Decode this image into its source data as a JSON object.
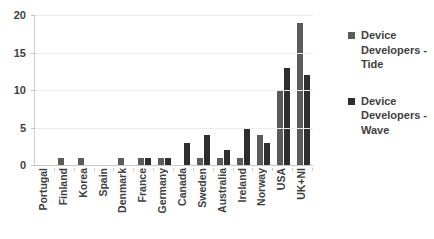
{
  "chart_data": {
    "type": "bar",
    "title": "",
    "subtitle": "",
    "xlabel": "",
    "ylabel": "",
    "ylim": [
      0,
      20
    ],
    "yticks": [
      0,
      5,
      10,
      15,
      20
    ],
    "ytick_labels": [
      "0",
      "5",
      "10",
      "15",
      "20"
    ],
    "grid": true,
    "legend_position": "right",
    "categories": [
      "Portugal",
      "Finland",
      "Korea",
      "Spain",
      "Denmark",
      "France",
      "Germany",
      "Canada",
      "Sweden",
      "Australia",
      "Ireland",
      "Norway",
      "USA",
      "UK+NI"
    ],
    "series": [
      {
        "name": "Device Developers - Tide",
        "color": "#5b5b5b",
        "values": [
          0,
          1,
          1,
          0,
          1,
          1,
          1,
          0,
          1,
          1,
          1,
          4,
          10,
          19
        ]
      },
      {
        "name": "Device Developers - Wave",
        "color": "#2e2e2e",
        "values": [
          0,
          0,
          0,
          0,
          0,
          1,
          1,
          3,
          4,
          2,
          5,
          3,
          13,
          12
        ]
      }
    ]
  },
  "legend": {
    "entries": [
      {
        "label": "Device Developers - Tide"
      },
      {
        "label": "Device Developers - Wave"
      }
    ]
  },
  "colors": {
    "tide": "#5b5b5b",
    "wave": "#2e2e2e",
    "gridline": "#ececec",
    "axis": "#c8c8c8",
    "text": "#3f3f3f",
    "background": "#ffffff"
  }
}
